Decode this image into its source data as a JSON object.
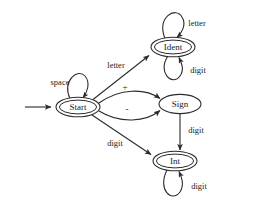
{
  "diagram": {
    "type": "finite-state-machine",
    "colors": {
      "stroke": "#2b2b2b",
      "text": "#1a1a1a",
      "background": "#ffffff"
    },
    "nodes": [
      {
        "id": "start",
        "label": "Start",
        "shape": "double-ellipse",
        "accepting": true,
        "cx": 78,
        "cy": 107,
        "rx": 22,
        "ry": 9.5
      },
      {
        "id": "ident",
        "label": "Ident",
        "shape": "double-ellipse",
        "accepting": true,
        "cx": 173,
        "cy": 47,
        "rx": 22,
        "ry": 9.5
      },
      {
        "id": "sign",
        "label": "Sign",
        "shape": "ellipse",
        "accepting": false,
        "cx": 180,
        "cy": 104,
        "rx": 21,
        "ry": 9.5
      },
      {
        "id": "int",
        "label": "Int",
        "shape": "double-ellipse",
        "accepting": true,
        "cx": 175,
        "cy": 161,
        "rx": 22,
        "ry": 9.5
      }
    ],
    "edges": [
      {
        "id": "entry",
        "from": "",
        "to": "start",
        "label": "",
        "kind": "entry-arrow"
      },
      {
        "id": "start-self",
        "from": "start",
        "to": "start",
        "label": "space",
        "kind": "self-loop-top"
      },
      {
        "id": "start-ident",
        "from": "start",
        "to": "ident",
        "label": "letter",
        "kind": "straight"
      },
      {
        "id": "start-sign-plus",
        "from": "start",
        "to": "sign",
        "label": "+",
        "kind": "curve-up"
      },
      {
        "id": "start-sign-minus",
        "from": "start",
        "to": "sign",
        "label": "-",
        "kind": "curve-down"
      },
      {
        "id": "start-int",
        "from": "start",
        "to": "int",
        "label": "digit",
        "kind": "straight"
      },
      {
        "id": "ident-self-letter",
        "from": "ident",
        "to": "ident",
        "label": "letter",
        "kind": "self-loop-top"
      },
      {
        "id": "ident-self-digit",
        "from": "ident",
        "to": "ident",
        "label": "digit",
        "kind": "self-loop-bottom"
      },
      {
        "id": "sign-int",
        "from": "sign",
        "to": "int",
        "label": "digit",
        "kind": "vertical"
      },
      {
        "id": "int-self-digit",
        "from": "int",
        "to": "int",
        "label": "digit",
        "kind": "self-loop-bottom"
      }
    ],
    "labels": {
      "space": "space",
      "letter_start_ident": "letter",
      "letter_ident_self": "letter",
      "digit_ident_self": "digit",
      "plus": "+",
      "minus": "-",
      "digit_start_int": "digit",
      "digit_sign_int": "digit",
      "digit_int_self": "digit"
    }
  }
}
